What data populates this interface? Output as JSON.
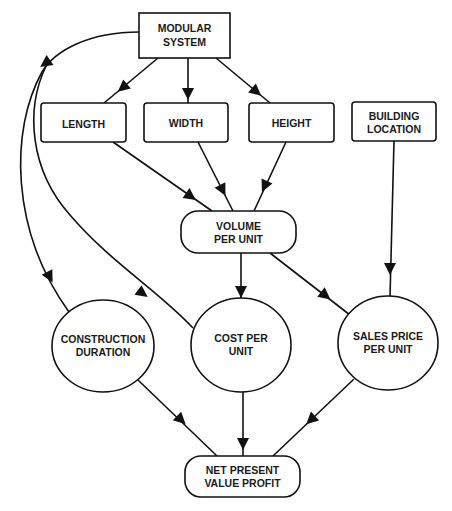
{
  "diagram": {
    "type": "influence-diagram",
    "nodes": {
      "modular_system": {
        "line1": "MODULAR",
        "line2": "SYSTEM",
        "shape": "rectangle"
      },
      "length": {
        "line1": "LENGTH",
        "shape": "rounded-rectangle"
      },
      "width": {
        "line1": "WIDTH",
        "shape": "rounded-rectangle"
      },
      "height": {
        "line1": "HEIGHT",
        "shape": "rounded-rectangle"
      },
      "building_location": {
        "line1": "BUILDING",
        "line2": "LOCATION",
        "shape": "rounded-rectangle"
      },
      "volume_per_unit": {
        "line1": "VOLUME",
        "line2": "PER UNIT",
        "shape": "pill"
      },
      "construction_duration": {
        "line1": "CONSTRUCTION",
        "line2": "DURATION",
        "shape": "circle"
      },
      "cost_per_unit": {
        "line1": "COST PER",
        "line2": "UNIT",
        "shape": "circle"
      },
      "sales_price_per_unit": {
        "line1": "SALES PRICE",
        "line2": "PER UNIT",
        "shape": "circle"
      },
      "npv_profit": {
        "line1": "NET PRESENT",
        "line2": "VALUE PROFIT",
        "shape": "pill"
      }
    },
    "edges": [
      {
        "from": "MODULAR SYSTEM",
        "to": "LENGTH"
      },
      {
        "from": "MODULAR SYSTEM",
        "to": "WIDTH"
      },
      {
        "from": "MODULAR SYSTEM",
        "to": "HEIGHT"
      },
      {
        "from": "MODULAR SYSTEM",
        "to": "CONSTRUCTION DURATION"
      },
      {
        "from": "MODULAR SYSTEM",
        "to": "COST PER UNIT"
      },
      {
        "from": "LENGTH",
        "to": "VOLUME PER UNIT"
      },
      {
        "from": "WIDTH",
        "to": "VOLUME PER UNIT"
      },
      {
        "from": "HEIGHT",
        "to": "VOLUME PER UNIT"
      },
      {
        "from": "VOLUME PER UNIT",
        "to": "COST PER UNIT"
      },
      {
        "from": "VOLUME PER UNIT",
        "to": "SALES PRICE PER UNIT"
      },
      {
        "from": "BUILDING LOCATION",
        "to": "SALES PRICE PER UNIT"
      },
      {
        "from": "CONSTRUCTION DURATION",
        "to": "NET PRESENT VALUE PROFIT"
      },
      {
        "from": "COST PER UNIT",
        "to": "NET PRESENT VALUE PROFIT"
      },
      {
        "from": "SALES PRICE PER UNIT",
        "to": "NET PRESENT VALUE PROFIT"
      }
    ],
    "colors": {
      "stroke": "#111111",
      "fill": "#ffffff",
      "text": "#1a1a1a"
    }
  }
}
